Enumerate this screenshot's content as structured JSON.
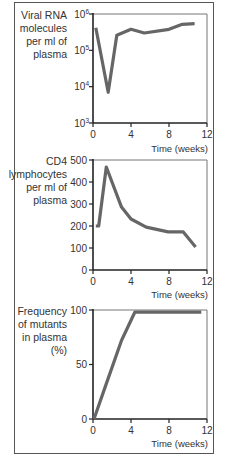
{
  "chart_data": [
    {
      "type": "line",
      "title": "",
      "ylabel": "Viral RNA molecules per ml of plasma",
      "ylabel_lines": [
        "Viral RNA",
        "molecules",
        "per ml of",
        "plasma"
      ],
      "xlabel": "Time (weeks)",
      "yscale": "log",
      "ylim": [
        1000,
        1000000
      ],
      "yticks": [
        1000,
        10000,
        100000,
        1000000
      ],
      "ytick_labels": [
        {
          "base": "10",
          "exp": "3"
        },
        {
          "base": "10",
          "exp": "4"
        },
        {
          "base": "10",
          "exp": "5"
        },
        {
          "base": "10",
          "exp": "6"
        }
      ],
      "xlim": [
        0,
        12
      ],
      "xticks": [
        0,
        4,
        8,
        12
      ],
      "series": [
        {
          "name": "Viral RNA",
          "x": [
            0.3,
            1.6,
            2.5,
            4.0,
            5.4,
            8.0,
            9.4,
            10.7
          ],
          "values": [
            420000,
            7000,
            260000,
            380000,
            300000,
            380000,
            520000,
            540000
          ]
        }
      ]
    },
    {
      "type": "line",
      "title": "",
      "ylabel": "CD4 lymphocytes per ml of plasma",
      "ylabel_lines": [
        "CD4",
        "lymphocytes",
        "per ml of",
        "plasma"
      ],
      "xlabel": "Time (weeks)",
      "yscale": "linear",
      "ylim": [
        0,
        500
      ],
      "yticks": [
        0,
        100,
        200,
        300,
        400,
        500
      ],
      "xlim": [
        0,
        12
      ],
      "xticks": [
        0,
        4,
        8,
        12
      ],
      "series": [
        {
          "name": "CD4 lymphocytes",
          "x": [
            0.3,
            0.6,
            1.4,
            3.0,
            4.0,
            5.6,
            7.9,
            9.5,
            10.8
          ],
          "values": [
            200,
            200,
            468,
            286,
            232,
            195,
            173,
            173,
            105
          ]
        }
      ]
    },
    {
      "type": "line",
      "title": "",
      "ylabel": "Frequency of mutants in plasma (%)",
      "ylabel_lines": [
        "Frequency",
        "of mutants",
        "in plasma",
        "(%)"
      ],
      "xlabel": "Time (weeks)",
      "yscale": "linear",
      "ylim": [
        0,
        100
      ],
      "yticks": [
        0,
        50,
        100
      ],
      "xlim": [
        0,
        12
      ],
      "xticks": [
        0,
        4,
        8,
        12
      ],
      "series": [
        {
          "name": "Mutant frequency",
          "x": [
            0.1,
            1.5,
            3.0,
            4.4,
            11.4
          ],
          "values": [
            0,
            35,
            72,
            98,
            98
          ]
        }
      ]
    }
  ],
  "style": {
    "line_color": "#666666",
    "axis_color": "#222222",
    "frame_color": "#555555"
  }
}
